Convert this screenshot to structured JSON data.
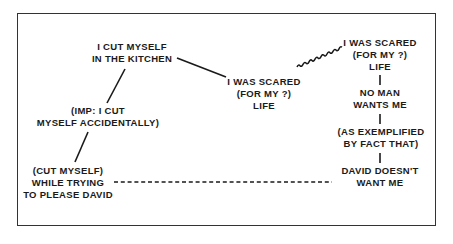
{
  "diagram": {
    "type": "associative-chain",
    "nodes": [
      {
        "id": "cut-kitchen",
        "lines": [
          "I CUT MYSELF",
          "IN THE KITCHEN"
        ]
      },
      {
        "id": "imp-cut-accidentally",
        "lines": [
          "(IMP: I CUT",
          "MYSELF ACCIDENTALLY)"
        ]
      },
      {
        "id": "cut-please-david",
        "lines": [
          "(CUT MYSELF)",
          "WHILE TRYING",
          "TO PLEASE DAVID"
        ]
      },
      {
        "id": "scared-life-middle",
        "lines": [
          "I WAS SCARED",
          "(FOR MY ?)",
          "LIFE"
        ]
      },
      {
        "id": "scared-life-right",
        "lines": [
          "I WAS SCARED",
          "(FOR MY ?)",
          "LIFE"
        ]
      },
      {
        "id": "no-man-wants",
        "lines": [
          "NO MAN",
          "WANTS ME"
        ]
      },
      {
        "id": "as-exemplified",
        "lines": [
          "(AS EXEMPLIFIED",
          "BY FACT THAT)"
        ]
      },
      {
        "id": "david-doesnt-want",
        "lines": [
          "DAVID DOESN'T",
          "WANT ME"
        ]
      }
    ],
    "edges": [
      {
        "from": "cut-kitchen",
        "to": "scared-life-middle",
        "style": "solid"
      },
      {
        "from": "cut-kitchen",
        "to": "imp-cut-accidentally",
        "style": "solid"
      },
      {
        "from": "imp-cut-accidentally",
        "to": "cut-please-david",
        "style": "solid"
      },
      {
        "from": "scared-life-middle",
        "to": "scared-life-right",
        "style": "wavy"
      },
      {
        "from": "scared-life-right",
        "to": "no-man-wants",
        "style": "solid"
      },
      {
        "from": "no-man-wants",
        "to": "as-exemplified",
        "style": "solid"
      },
      {
        "from": "as-exemplified",
        "to": "david-doesnt-want",
        "style": "solid"
      },
      {
        "from": "cut-please-david",
        "to": "david-doesnt-want",
        "style": "dashed"
      }
    ]
  },
  "colors": {
    "ink": "#1a1a1a",
    "frame": "#333333",
    "background": "#ffffff"
  }
}
